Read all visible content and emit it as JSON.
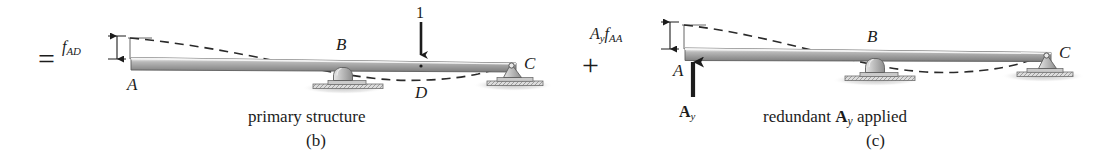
{
  "figure": {
    "type": "structural-analysis-diagram",
    "colors": {
      "ink": "#1c1c1c",
      "beam_top": "#f2f2f2",
      "beam_light": "#d9d9d9",
      "beam_mid": "#9a9a9a",
      "beam_dark": "#6e6e6e",
      "support_fill": "#b8b8b8",
      "ground_hatch": "#8a8a8a",
      "shadow": "#cfcfcf",
      "dashed_curve": "#2a2a2a"
    }
  },
  "operators": {
    "equals": "=",
    "plus": "+"
  },
  "panel_b": {
    "caption": "primary structure",
    "figure_label": "(b)",
    "dimension_label_parts": {
      "base": "f",
      "sub": "AD"
    },
    "dimension_label_text": "fAD",
    "load_magnitude": "1",
    "nodes": [
      {
        "name": "A",
        "role": "free-end"
      },
      {
        "name": "B",
        "role": "roller-support"
      },
      {
        "name": "C",
        "role": "pin-support"
      },
      {
        "name": "D",
        "role": "load-point"
      }
    ]
  },
  "panel_c": {
    "caption_parts": {
      "pre": "redundant ",
      "force_base": "A",
      "force_sub": "y",
      "post": " applied"
    },
    "caption_text": "redundant Ay applied",
    "figure_label": "(c)",
    "dimension_label_parts": {
      "first_base": "A",
      "first_sub": "y",
      "second_base": "f",
      "second_sub": "AA"
    },
    "dimension_label_text": "Ay fAA",
    "force_label_parts": {
      "base": "A",
      "sub": "y"
    },
    "force_label_text": "Ay",
    "nodes": [
      {
        "name": "A",
        "role": "loaded-end"
      },
      {
        "name": "B",
        "role": "roller-support"
      },
      {
        "name": "C",
        "role": "pin-support"
      }
    ]
  }
}
